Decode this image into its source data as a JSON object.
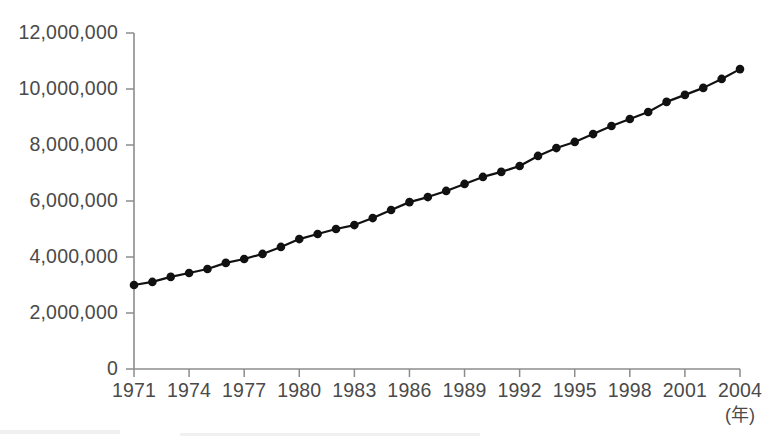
{
  "chart_data": {
    "type": "line",
    "title": "",
    "subtitle": "",
    "xlabel": "(年)",
    "ylabel": "",
    "xlim": [
      1971,
      2004
    ],
    "ylim": [
      0,
      12000000
    ],
    "grid": false,
    "legend": null,
    "legend_position": "none",
    "x_tick_step": 3,
    "y_tick_step": 2000000,
    "x_tick_labels": [
      "1971",
      "1974",
      "1977",
      "1980",
      "1983",
      "1986",
      "1989",
      "1992",
      "1995",
      "1998",
      "2001",
      "2004"
    ],
    "y_tick_labels": [
      "0",
      "2,000,000",
      "4,000,000",
      "6,000,000",
      "8,000,000",
      "10,000,000",
      "12,000,000"
    ],
    "y_tick_values": [
      0,
      2000000,
      4000000,
      6000000,
      8000000,
      10000000,
      12000000
    ],
    "marker": "filled-circle",
    "series": [
      {
        "name": "",
        "color": "#111111",
        "x": [
          1971,
          1972,
          1973,
          1974,
          1975,
          1976,
          1977,
          1978,
          1979,
          1980,
          1981,
          1982,
          1983,
          1984,
          1985,
          1986,
          1987,
          1988,
          1989,
          1990,
          1991,
          1992,
          1993,
          1994,
          1995,
          1996,
          1997,
          1998,
          1999,
          2000,
          2001,
          2002,
          2003,
          2004
        ],
        "values": [
          3000000,
          3110000,
          3290000,
          3430000,
          3570000,
          3790000,
          3930000,
          4110000,
          4360000,
          4640000,
          4820000,
          5000000,
          5140000,
          5390000,
          5680000,
          5960000,
          6140000,
          6360000,
          6610000,
          6860000,
          7040000,
          7250000,
          7610000,
          7890000,
          8110000,
          8390000,
          8680000,
          8930000,
          9180000,
          9540000,
          9790000,
          10040000,
          10360000,
          10710000
        ]
      }
    ]
  }
}
